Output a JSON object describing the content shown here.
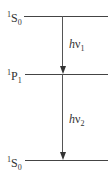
{
  "diagram": {
    "type": "energy-level-diagram",
    "levels": [
      {
        "id": "top",
        "term_sup": "1",
        "term_main": "S",
        "term_sub": "0",
        "y": 16
      },
      {
        "id": "middle",
        "term_sup": "1",
        "term_main": "P",
        "term_sub": "1",
        "y": 74
      },
      {
        "id": "bottom",
        "term_sup": "1",
        "term_main": "S",
        "term_sub": "0",
        "y": 160
      }
    ],
    "transitions": [
      {
        "id": "t1",
        "from": "top",
        "to": "middle",
        "label_h": "h",
        "label_nu": "ν",
        "label_sub": "1"
      },
      {
        "id": "t2",
        "from": "middle",
        "to": "bottom",
        "label_h": "h",
        "label_nu": "ν",
        "label_sub": "2"
      }
    ],
    "colors": {
      "line": "#444444",
      "text": "#333333",
      "background": "#ffffff"
    }
  }
}
